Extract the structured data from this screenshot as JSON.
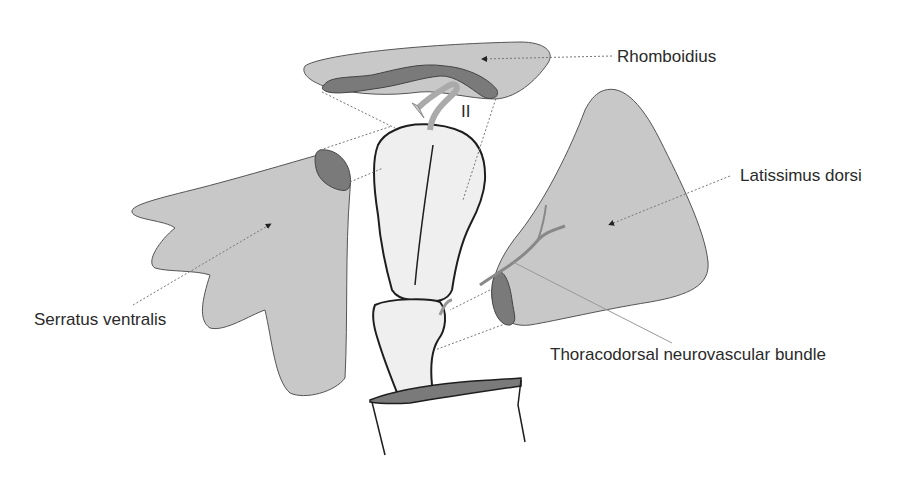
{
  "figure": {
    "labels": {
      "rhomboidius": "Rhomboidius",
      "latissimus": "Latissimus dorsi",
      "serratus": "Serratus ventralis",
      "thoracodorsal": "Thoracodorsal neurovascular bundle",
      "roman_numeral": "II"
    },
    "colors": {
      "muscle_fill": "#c8c8c8",
      "insertion_fill": "#7a7a7a",
      "bone_fill": "#efefef",
      "outline": "#1e1e1e",
      "leader_line": "#777777",
      "text": "#2a2a2a"
    }
  }
}
